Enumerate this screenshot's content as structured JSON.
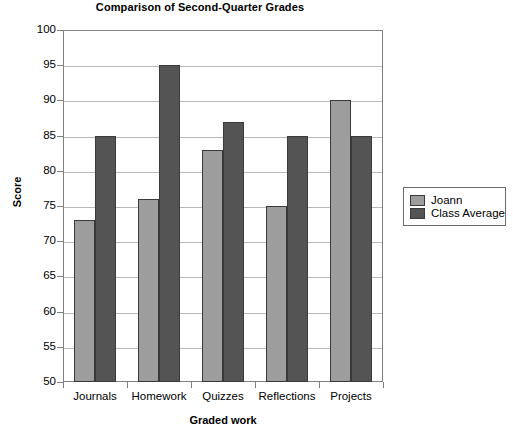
{
  "chart_data": {
    "type": "bar",
    "title": "Comparison of Second-Quarter Grades",
    "xlabel": "Graded work",
    "ylabel": "Score",
    "categories": [
      "Journals",
      "Homework",
      "Quizzes",
      "Reflections",
      "Projects"
    ],
    "series": [
      {
        "name": "Joann",
        "values": [
          73,
          76,
          83,
          75,
          90
        ],
        "color": "#9d9d9d"
      },
      {
        "name": "Class Average",
        "values": [
          85,
          95,
          87,
          85,
          85
        ],
        "color": "#545454"
      }
    ],
    "ylim": [
      50,
      100
    ],
    "ytick_step": 5,
    "yticks": [
      100,
      95,
      90,
      85,
      80,
      75,
      70,
      65,
      60,
      55,
      50
    ],
    "ytick_labels": [
      "100",
      "95",
      "90",
      "85",
      "80",
      "75",
      "70",
      "65",
      "60",
      "55",
      "50"
    ],
    "grid": true,
    "grid_axis": "y",
    "legend_position": "right",
    "legend_entries": [
      "Joann",
      "Class Average"
    ]
  },
  "legend": {
    "entry_0": "Joann",
    "entry_1": "Class Average"
  }
}
